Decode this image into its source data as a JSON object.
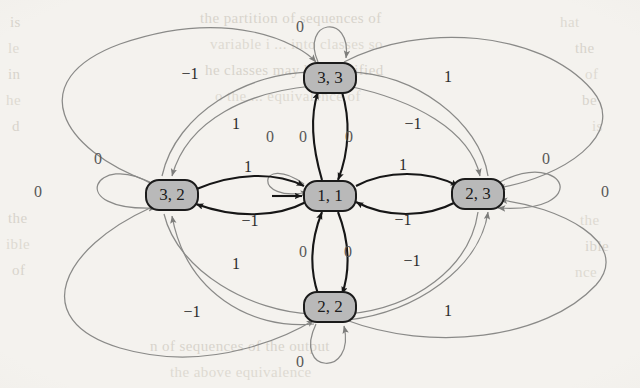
{
  "figure": {
    "type": "state-transition-diagram",
    "background_color": "#f4f2ee",
    "node_fill_color": "#b9b9b9",
    "node_stroke_color": "#1b1b1b",
    "bold_edge_color": "#161616",
    "thin_edge_color": "#8a8a88"
  },
  "nodes": [
    {
      "id": "n33",
      "label": "3, 3",
      "x": 330,
      "y": 78
    },
    {
      "id": "n32",
      "label": "3, 2",
      "x": 172,
      "y": 195
    },
    {
      "id": "n11",
      "label": "1, 1",
      "x": 330,
      "y": 196
    },
    {
      "id": "n23",
      "label": "2, 3",
      "x": 478,
      "y": 194
    },
    {
      "id": "n22",
      "label": "2, 2",
      "x": 330,
      "y": 307
    }
  ],
  "start_marker": {
    "target": "n11",
    "label": ""
  },
  "edge_labels": [
    {
      "id": "loop-33",
      "text": "0",
      "x": 300,
      "y": 28
    },
    {
      "id": "loop-22",
      "text": "0",
      "x": 300,
      "y": 363
    },
    {
      "id": "loop-32",
      "text": "0",
      "x": 98,
      "y": 160
    },
    {
      "id": "loop-23",
      "text": "0",
      "x": 546,
      "y": 160
    },
    {
      "id": "loop-11",
      "text": "0",
      "x": 270,
      "y": 138
    },
    {
      "id": "outer-left",
      "text": "0",
      "x": 38,
      "y": 193
    },
    {
      "id": "outer-right",
      "text": "0",
      "x": 605,
      "y": 193
    },
    {
      "id": "tl-neg1",
      "text": "−1",
      "x": 190,
      "y": 75
    },
    {
      "id": "tl-one",
      "text": "1",
      "x": 236,
      "y": 125
    },
    {
      "id": "tr-one",
      "text": "1",
      "x": 448,
      "y": 78
    },
    {
      "id": "tr-neg1",
      "text": "−1",
      "x": 413,
      "y": 125
    },
    {
      "id": "up-left-0",
      "text": "0",
      "x": 303,
      "y": 138
    },
    {
      "id": "up-right-0",
      "text": "0",
      "x": 349,
      "y": 138
    },
    {
      "id": "west-one",
      "text": "1",
      "x": 248,
      "y": 168
    },
    {
      "id": "west-neg1",
      "text": "−1",
      "x": 250,
      "y": 222
    },
    {
      "id": "east-one",
      "text": "1",
      "x": 403,
      "y": 166
    },
    {
      "id": "east-neg1",
      "text": "−1",
      "x": 403,
      "y": 221
    },
    {
      "id": "dn-left-0",
      "text": "0",
      "x": 303,
      "y": 253
    },
    {
      "id": "dn-right-0",
      "text": "0",
      "x": 348,
      "y": 253
    },
    {
      "id": "bl-one",
      "text": "1",
      "x": 236,
      "y": 265
    },
    {
      "id": "bl-neg1",
      "text": "−1",
      "x": 192,
      "y": 313
    },
    {
      "id": "br-neg1",
      "text": "−1",
      "x": 412,
      "y": 262
    },
    {
      "id": "br-one",
      "text": "1",
      "x": 448,
      "y": 312
    }
  ],
  "transitions": [
    {
      "from": "3, 3",
      "to": "3, 3",
      "label": "0"
    },
    {
      "from": "2, 2",
      "to": "2, 2",
      "label": "0"
    },
    {
      "from": "3, 2",
      "to": "3, 2",
      "label": "0"
    },
    {
      "from": "2, 3",
      "to": "2, 3",
      "label": "0"
    },
    {
      "from": "1, 1",
      "to": "1, 1",
      "label": "0"
    },
    {
      "from": "3, 2",
      "to": "1, 1",
      "label": "1"
    },
    {
      "from": "1, 1",
      "to": "3, 2",
      "label": "−1"
    },
    {
      "from": "1, 1",
      "to": "2, 3",
      "label": "1"
    },
    {
      "from": "2, 3",
      "to": "1, 1",
      "label": "−1"
    },
    {
      "from": "1, 1",
      "to": "3, 3",
      "label": "0"
    },
    {
      "from": "3, 3",
      "to": "1, 1",
      "label": "0"
    },
    {
      "from": "1, 1",
      "to": "2, 2",
      "label": "0"
    },
    {
      "from": "2, 2",
      "to": "1, 1",
      "label": "0"
    },
    {
      "from": "3, 2",
      "to": "3, 3",
      "label": "1"
    },
    {
      "from": "3, 3",
      "to": "3, 2",
      "label": "−1"
    },
    {
      "from": "3, 3",
      "to": "2, 3",
      "label": "−1"
    },
    {
      "from": "2, 3",
      "to": "3, 3",
      "label": "1"
    },
    {
      "from": "3, 2",
      "to": "2, 2",
      "label": "1"
    },
    {
      "from": "2, 2",
      "to": "3, 2",
      "label": "−1"
    },
    {
      "from": "2, 2",
      "to": "2, 3",
      "label": "1"
    },
    {
      "from": "2, 3",
      "to": "2, 2",
      "label": "−1"
    },
    {
      "from": "3, 2",
      "to": "2, 3",
      "label": "0"
    },
    {
      "from": "2, 3",
      "to": "3, 2",
      "label": "0"
    }
  ],
  "bleed_through_text": [
    {
      "text": "the  partition  of  sequences  of",
      "x": 200,
      "y": 10,
      "size": 15
    },
    {
      "text": "variable  i  ... into  classes  so",
      "x": 210,
      "y": 36,
      "size": 15
    },
    {
      "text": "he  classes  may  be  classified",
      "x": 205,
      "y": 62,
      "size": 15
    },
    {
      "text": "o  the  ...  equivalence  of",
      "x": 215,
      "y": 88,
      "size": 15
    },
    {
      "text": "is",
      "x": 10,
      "y": 14,
      "size": 15
    },
    {
      "text": "le",
      "x": 8,
      "y": 40,
      "size": 15
    },
    {
      "text": "in",
      "x": 8,
      "y": 66,
      "size": 15
    },
    {
      "text": "he",
      "x": 6,
      "y": 92,
      "size": 15
    },
    {
      "text": "d",
      "x": 12,
      "y": 118,
      "size": 15
    },
    {
      "text": "hat",
      "x": 560,
      "y": 14,
      "size": 15
    },
    {
      "text": "the",
      "x": 575,
      "y": 40,
      "size": 15
    },
    {
      "text": "of",
      "x": 585,
      "y": 66,
      "size": 15
    },
    {
      "text": "be",
      "x": 582,
      "y": 92,
      "size": 15
    },
    {
      "text": "is",
      "x": 592,
      "y": 118,
      "size": 15
    },
    {
      "text": "the",
      "x": 8,
      "y": 210,
      "size": 15
    },
    {
      "text": "ible",
      "x": 6,
      "y": 236,
      "size": 15
    },
    {
      "text": "of",
      "x": 12,
      "y": 262,
      "size": 15
    },
    {
      "text": "the",
      "x": 580,
      "y": 212,
      "size": 15
    },
    {
      "text": "ible",
      "x": 585,
      "y": 238,
      "size": 15
    },
    {
      "text": "nce",
      "x": 575,
      "y": 264,
      "size": 15
    },
    {
      "text": "n  of  sequences  of  the  output",
      "x": 150,
      "y": 338,
      "size": 15
    },
    {
      "text": "the  above  equivalence",
      "x": 170,
      "y": 364,
      "size": 15
    }
  ]
}
